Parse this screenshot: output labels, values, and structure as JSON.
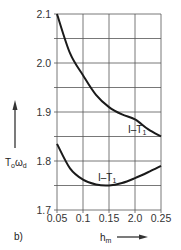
{
  "panel_label": "b)",
  "chart_data": {
    "type": "line",
    "title": "",
    "xlabel": "h_m",
    "ylabel": "T_o ω_d",
    "xlim": [
      0.05,
      0.25
    ],
    "ylim": [
      1.7,
      2.1
    ],
    "grid": true,
    "x_ticks": [
      "0.05",
      "0.1",
      "0.15",
      "2.0",
      "0.25"
    ],
    "y_ticks": [
      "1.7",
      "1.8",
      "1.9",
      "2.0",
      "2.1"
    ],
    "legend": "none (curves labeled inline)",
    "series": [
      {
        "name": "I–T1 (upper)",
        "label": "I–T",
        "label_sub": "1",
        "x": [
          0.05,
          0.075,
          0.1,
          0.125,
          0.15,
          0.175,
          0.2,
          0.225,
          0.25
        ],
        "y": [
          2.1,
          2.02,
          1.975,
          1.935,
          1.91,
          1.895,
          1.885,
          1.865,
          1.85
        ]
      },
      {
        "name": "I–T1 (lower)",
        "label": "I–T",
        "label_sub": "1",
        "x": [
          0.05,
          0.075,
          0.1,
          0.125,
          0.15,
          0.175,
          0.2,
          0.225,
          0.25
        ],
        "y": [
          1.835,
          1.785,
          1.762,
          1.752,
          1.75,
          1.755,
          1.765,
          1.777,
          1.79
        ]
      }
    ]
  },
  "axis": {
    "y_label_main": "T",
    "y_label_sub1": "o",
    "y_label_mid": "ω",
    "y_label_sub2": "d",
    "x_label_main": "h",
    "x_label_sub": "m"
  }
}
